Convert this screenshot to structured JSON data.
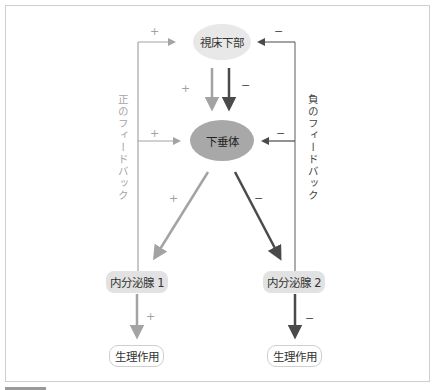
{
  "diagram": {
    "nodes": {
      "hypothalamus": "視床下部",
      "pituitary": "下垂体",
      "gland1": "内分泌腺 1",
      "gland2": "内分泌腺 2",
      "effect1": "生理作用",
      "effect2": "生理作用"
    },
    "labels": {
      "positive_feedback": "正のフィードバック",
      "negative_feedback": "負のフィードバック"
    },
    "signs": {
      "top_left": "+",
      "top_right": "−",
      "hyp_down_pos": "+",
      "hyp_down_neg": "−",
      "mid_left": "+",
      "mid_right": "−",
      "diag_left": "+",
      "diag_right": "−",
      "gland1_down": "+",
      "gland2_down": "−"
    },
    "colors": {
      "positive": "#a3a3a3",
      "negative": "#4a4a4a",
      "hypothalamus_fill": "#e8e8e8",
      "pituitary_fill": "#a8a8a8",
      "gland_fill": "#e2e2e2"
    }
  }
}
